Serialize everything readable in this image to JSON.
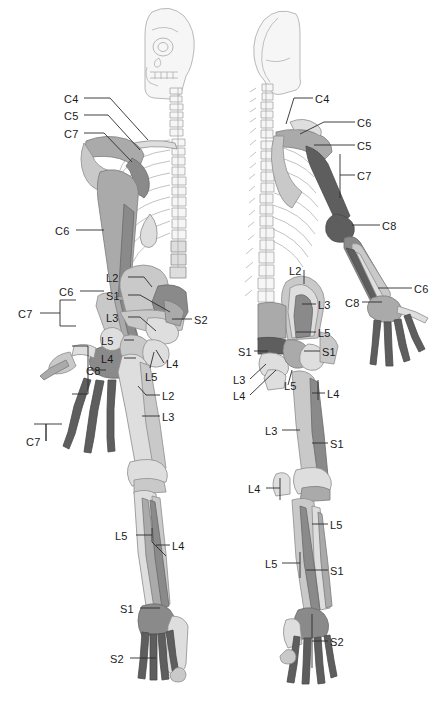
{
  "figure": {
    "views": [
      {
        "name": "anterior-view",
        "side": "left"
      },
      {
        "name": "posterior-view",
        "side": "right"
      }
    ],
    "palette": {
      "background": "#ffffff",
      "outline": "#8d8d8d",
      "ghost_bone": "#f2f2f2",
      "tone_lightest": "#dedede",
      "tone_light": "#c9c9c9",
      "tone_mid": "#aaaaaa",
      "tone_dark": "#8a8a8a",
      "tone_darkest": "#5e5e5e",
      "leader_line": "#2b2b2b",
      "label_text": "#1a1a1a"
    }
  },
  "labels": {
    "anterior": [
      {
        "id": "a-c4",
        "text": "C4",
        "x": 64,
        "y": 94,
        "align": "left"
      },
      {
        "id": "a-c5",
        "text": "C5",
        "x": 64,
        "y": 111,
        "align": "left"
      },
      {
        "id": "a-c7-shoulder",
        "text": "C7",
        "x": 64,
        "y": 129,
        "align": "left"
      },
      {
        "id": "a-c6-arm",
        "text": "C6",
        "x": 55,
        "y": 226,
        "align": "left"
      },
      {
        "id": "a-c6-forearm",
        "text": "C6",
        "x": 59,
        "y": 287,
        "align": "left"
      },
      {
        "id": "a-c7-forearm",
        "text": "C7",
        "x": 18,
        "y": 309,
        "align": "left"
      },
      {
        "id": "a-c8-hand",
        "text": "C8",
        "x": 86,
        "y": 366,
        "align": "left"
      },
      {
        "id": "a-c7-digits",
        "text": "C7",
        "x": 26,
        "y": 437,
        "align": "left"
      },
      {
        "id": "a-l2-ilium",
        "text": "L2",
        "x": 106,
        "y": 273,
        "align": "left"
      },
      {
        "id": "a-s1-ilium",
        "text": "S1",
        "x": 106,
        "y": 291,
        "align": "left"
      },
      {
        "id": "a-l3-ilium",
        "text": "L3",
        "x": 106,
        "y": 313,
        "align": "left"
      },
      {
        "id": "a-s2-sacrum",
        "text": "S2",
        "x": 194,
        "y": 315,
        "align": "left"
      },
      {
        "id": "a-l5-hip",
        "text": "L5",
        "x": 101,
        "y": 336,
        "align": "left"
      },
      {
        "id": "a-l4-hip",
        "text": "L4",
        "x": 101,
        "y": 354,
        "align": "left"
      },
      {
        "id": "a-l4-femur",
        "text": "L4",
        "x": 166,
        "y": 359,
        "align": "left"
      },
      {
        "id": "a-l5-femur",
        "text": "L5",
        "x": 145,
        "y": 372,
        "align": "left"
      },
      {
        "id": "a-l2-thigh",
        "text": "L2",
        "x": 162,
        "y": 391,
        "align": "left"
      },
      {
        "id": "a-l3-thigh",
        "text": "L3",
        "x": 162,
        "y": 412,
        "align": "left"
      },
      {
        "id": "a-l5-leg",
        "text": "L5",
        "x": 115,
        "y": 531,
        "align": "left"
      },
      {
        "id": "a-l4-leg",
        "text": "L4",
        "x": 172,
        "y": 541,
        "align": "left"
      },
      {
        "id": "a-s1-ankle",
        "text": "S1",
        "x": 120,
        "y": 604,
        "align": "left"
      },
      {
        "id": "a-s2-toes",
        "text": "S2",
        "x": 110,
        "y": 654,
        "align": "left"
      }
    ],
    "posterior": [
      {
        "id": "p-c4",
        "text": "C4",
        "x": 315,
        "y": 94,
        "align": "left"
      },
      {
        "id": "p-c6-shoulder",
        "text": "C6",
        "x": 357,
        "y": 118,
        "align": "left"
      },
      {
        "id": "p-c5",
        "text": "C5",
        "x": 357,
        "y": 141,
        "align": "left"
      },
      {
        "id": "p-c7-arm",
        "text": "C7",
        "x": 357,
        "y": 171,
        "align": "left"
      },
      {
        "id": "p-c8-elbow",
        "text": "C8",
        "x": 382,
        "y": 221,
        "align": "left"
      },
      {
        "id": "p-c6-forearm",
        "text": "C6",
        "x": 414,
        "y": 284,
        "align": "left"
      },
      {
        "id": "p-c8-forearm",
        "text": "C8",
        "x": 345,
        "y": 298,
        "align": "left"
      },
      {
        "id": "p-l2-ilium",
        "text": "L2",
        "x": 289,
        "y": 266,
        "align": "left"
      },
      {
        "id": "p-l3-ilium",
        "text": "L3",
        "x": 318,
        "y": 300,
        "align": "left"
      },
      {
        "id": "p-l5-hip",
        "text": "L5",
        "x": 318,
        "y": 328,
        "align": "left"
      },
      {
        "id": "p-s1-left",
        "text": "S1",
        "x": 238,
        "y": 347,
        "align": "left"
      },
      {
        "id": "p-s1-right",
        "text": "S1",
        "x": 322,
        "y": 347,
        "align": "left"
      },
      {
        "id": "p-l3-pelvis",
        "text": "L3",
        "x": 233,
        "y": 375,
        "align": "left"
      },
      {
        "id": "p-l5-pelvis",
        "text": "L5",
        "x": 284,
        "y": 381,
        "align": "left"
      },
      {
        "id": "p-l4-pelvis",
        "text": "L4",
        "x": 233,
        "y": 391,
        "align": "left"
      },
      {
        "id": "p-l4-femur",
        "text": "L4",
        "x": 327,
        "y": 389,
        "align": "left"
      },
      {
        "id": "p-l3-thigh",
        "text": "L3",
        "x": 265,
        "y": 426,
        "align": "left"
      },
      {
        "id": "p-s1-thigh",
        "text": "S1",
        "x": 330,
        "y": 439,
        "align": "left"
      },
      {
        "id": "p-l4-knee",
        "text": "L4",
        "x": 248,
        "y": 484,
        "align": "left"
      },
      {
        "id": "p-l5-knee",
        "text": "L5",
        "x": 330,
        "y": 520,
        "align": "left"
      },
      {
        "id": "p-l5-leg",
        "text": "L5",
        "x": 265,
        "y": 559,
        "align": "left"
      },
      {
        "id": "p-s1-leg",
        "text": "S1",
        "x": 330,
        "y": 566,
        "align": "left"
      },
      {
        "id": "p-s2-foot",
        "text": "S2",
        "x": 330,
        "y": 637,
        "align": "left"
      }
    ]
  }
}
